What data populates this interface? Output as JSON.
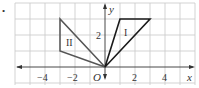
{
  "figure": {
    "bullet": "•",
    "axes": {
      "x_label": "x",
      "y_label": "y",
      "origin_label": "O",
      "x_tick_labels": [
        {
          "value": -4,
          "text": "−4"
        },
        {
          "value": -2,
          "text": "−2"
        },
        {
          "value": 2,
          "text": "2"
        },
        {
          "value": 4,
          "text": "4"
        }
      ],
      "y_tick_labels": [
        {
          "value": 2,
          "text": "2"
        }
      ],
      "x_range": [
        -6,
        6
      ],
      "y_range": [
        -1,
        4
      ]
    },
    "shapes": [
      {
        "label": "I",
        "vertices": [
          [
            0,
            0
          ],
          [
            1,
            3
          ],
          [
            3,
            3
          ]
        ]
      },
      {
        "label": "II",
        "vertices": [
          [
            0,
            0
          ],
          [
            -3,
            3
          ],
          [
            -3,
            1
          ]
        ]
      }
    ],
    "colors": {
      "grid": "#c8c8c8",
      "axis": "#333333",
      "shape_stroke": "#1a1a1a",
      "shape_II_stroke": "#555555"
    }
  }
}
